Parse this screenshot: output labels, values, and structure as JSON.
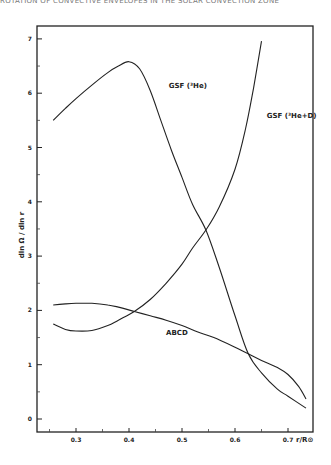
{
  "header": {
    "text": "ROTATION OF CONVECTIVE ENVELOPES IN THE SOLAR CONVECTION ZONE"
  },
  "chart_data": {
    "type": "line",
    "title": "",
    "xlabel": "r/R⊙",
    "ylabel": "dln Ω / dln r",
    "xlim": [
      0.226,
      0.747
    ],
    "ylim": [
      -0.22,
      7.2
    ],
    "xticks": [
      0.3,
      0.4,
      0.5,
      0.6,
      0.7
    ],
    "xticks_minor": [
      0.25,
      0.35,
      0.45,
      0.55,
      0.65
    ],
    "yticks": [
      0,
      1,
      2,
      3,
      4,
      5,
      6,
      7
    ],
    "grid": false,
    "legend": "inline labels",
    "series": [
      {
        "name": "GSF (³He)",
        "label_pos": [
          0.475,
          6.1
        ],
        "x": [
          0.257,
          0.28,
          0.3,
          0.33,
          0.36,
          0.38,
          0.4,
          0.42,
          0.44,
          0.46,
          0.48,
          0.5,
          0.52,
          0.545,
          0.57,
          0.6,
          0.625,
          0.65,
          0.68,
          0.7,
          0.734
        ],
        "y": [
          5.5,
          5.72,
          5.9,
          6.15,
          6.38,
          6.5,
          6.58,
          6.45,
          6.05,
          5.5,
          4.95,
          4.45,
          3.95,
          3.48,
          2.8,
          1.9,
          1.2,
          0.85,
          0.55,
          0.42,
          0.2
        ]
      },
      {
        "name": "GSF (³He+D)",
        "label_pos": [
          0.66,
          5.55
        ],
        "x": [
          0.257,
          0.28,
          0.3,
          0.33,
          0.36,
          0.38,
          0.41,
          0.44,
          0.47,
          0.5,
          0.52,
          0.545,
          0.57,
          0.6,
          0.62,
          0.635,
          0.65
        ],
        "y": [
          1.75,
          1.65,
          1.62,
          1.63,
          1.72,
          1.82,
          1.98,
          2.2,
          2.5,
          2.85,
          3.15,
          3.48,
          3.9,
          4.6,
          5.35,
          6.1,
          6.96
        ]
      },
      {
        "name": "ABCD",
        "label_pos": [
          0.47,
          1.55
        ],
        "x": [
          0.257,
          0.28,
          0.3,
          0.33,
          0.36,
          0.38,
          0.41,
          0.44,
          0.47,
          0.5,
          0.53,
          0.56,
          0.6,
          0.625,
          0.65,
          0.68,
          0.7,
          0.72,
          0.734
        ],
        "y": [
          2.1,
          2.12,
          2.13,
          2.13,
          2.1,
          2.06,
          1.98,
          1.9,
          1.82,
          1.72,
          1.6,
          1.5,
          1.32,
          1.2,
          1.08,
          0.95,
          0.82,
          0.6,
          0.37
        ]
      }
    ]
  }
}
